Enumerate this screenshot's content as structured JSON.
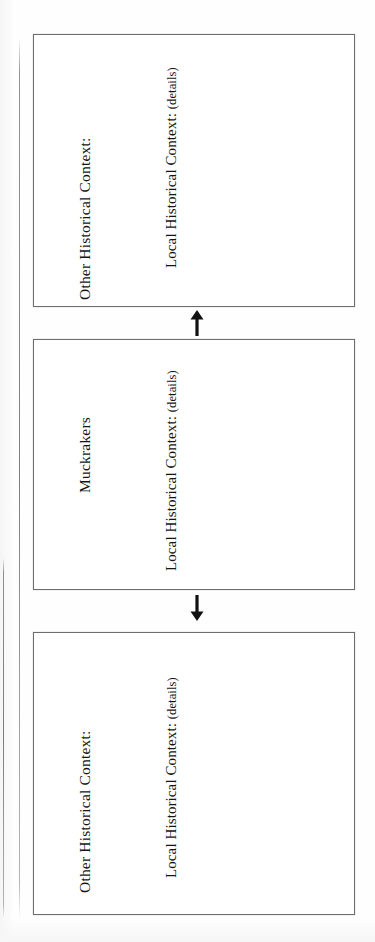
{
  "document": {
    "type": "graphic-organizer",
    "orientation": "text rotated 90 degrees counter-clockwise (sideways scan)",
    "page_background": "#ffffff",
    "ink_color": "#141414",
    "box_border_color": "#6d6d6d"
  },
  "boxes": [
    {
      "id": "box-1",
      "title": "Other Historical Context:",
      "detail_label": "Local Historical Context:",
      "detail_suffix": "(details)",
      "detail_full": "Local Historical Context: (details)"
    },
    {
      "id": "box-2",
      "title": "Muckrakers",
      "detail_label": "Local Historical Context:",
      "detail_suffix": "(details)",
      "detail_full": "Local Historical Context: (details)"
    },
    {
      "id": "box-3",
      "title": "Other Historical Context:",
      "detail_label": "Local Historical Context:",
      "detail_suffix": "(details)",
      "detail_full": "Local Historical Context: (details)"
    }
  ],
  "connectors": [
    {
      "id": "connector-1",
      "icon": "arrow-up-icon",
      "direction": "up",
      "from": "box-2",
      "to": "box-1"
    },
    {
      "id": "connector-2",
      "icon": "arrow-down-icon",
      "direction": "down",
      "from": "box-2",
      "to": "box-3"
    }
  ],
  "margin_lines": [
    {
      "id": "outer-fold-line",
      "name": "scan-fold-line-outer"
    },
    {
      "id": "inner-fold-line",
      "name": "scan-fold-line-inner"
    }
  ]
}
